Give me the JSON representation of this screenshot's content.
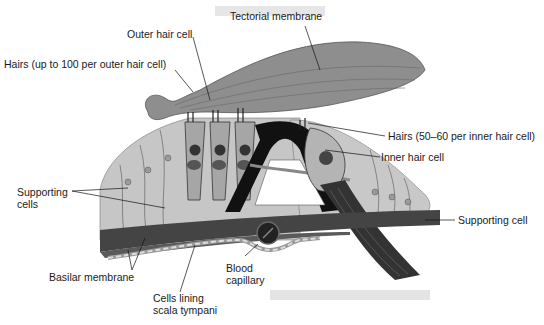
{
  "diagram": {
    "labels": {
      "tectorial_membrane": "Tectorial membrane",
      "outer_hair_cell": "Outer hair cell",
      "hairs_outer": "Hairs (up to 100 per outer hair cell)",
      "hairs_inner": "Hairs (50–60 per inner hair cell)",
      "inner_hair_cell": "Inner hair cell",
      "supporting_cells_line1": "Supporting",
      "supporting_cells_line2": "cells",
      "supporting_cell": "Supporting cell",
      "basilar_membrane": "Basilar membrane",
      "blood_capillary_line1": "Blood",
      "blood_capillary_line2": "capillary",
      "cells_lining_line1": "Cells lining",
      "cells_lining_line2": "scala tympani"
    },
    "colors": {
      "tissue_light": "#c4c4c4",
      "tissue_mid": "#9a9a9a",
      "membrane_dark": "#555555",
      "ink": "#111111"
    }
  }
}
